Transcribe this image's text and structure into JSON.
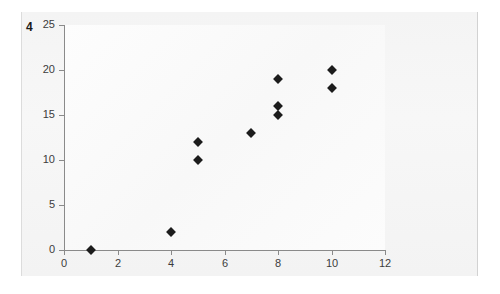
{
  "figure": {
    "number": "4"
  },
  "chart_data": {
    "type": "scatter",
    "title": "",
    "subtitle": "",
    "xlabel": "",
    "ylabel": "",
    "xlim": [
      0,
      12
    ],
    "ylim": [
      0,
      25
    ],
    "xticks": [
      "0",
      "2",
      "4",
      "6",
      "8",
      "10",
      "12"
    ],
    "xtick_values": [
      0,
      2,
      4,
      6,
      8,
      10,
      12
    ],
    "yticks": [
      "0",
      "5",
      "10",
      "15",
      "20",
      "25"
    ],
    "ytick_values": [
      0,
      5,
      10,
      15,
      20,
      25
    ],
    "grid": false,
    "legend": null,
    "marker": "diamond",
    "marker_color": "#1c1c1c",
    "points": [
      {
        "x": 1,
        "y": 0
      },
      {
        "x": 4,
        "y": 2
      },
      {
        "x": 5,
        "y": 10
      },
      {
        "x": 5,
        "y": 12
      },
      {
        "x": 7,
        "y": 13
      },
      {
        "x": 8,
        "y": 15
      },
      {
        "x": 8,
        "y": 16
      },
      {
        "x": 8,
        "y": 19
      },
      {
        "x": 10,
        "y": 18
      },
      {
        "x": 10,
        "y": 20
      }
    ],
    "annotations": []
  },
  "colors": {
    "panel_background": "#f5f5f5",
    "plot_background": "#fbfbfb",
    "axis": "#8a8a8a",
    "tick_label": "#3c3c3c",
    "marker": "#1c1c1c"
  }
}
